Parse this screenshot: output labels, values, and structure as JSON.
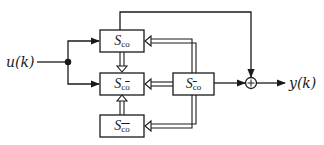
{
  "diagram": {
    "type": "block-diagram",
    "colors": {
      "stroke": "#1a1a1a",
      "background": "#ffffff"
    },
    "input": {
      "label": "u(k)"
    },
    "output": {
      "label": "y(k)"
    },
    "blocks": [
      {
        "id": "s_co",
        "symbol": "S",
        "subscript": "co",
        "sub_c_bar": false,
        "sub_o_bar": false
      },
      {
        "id": "s_c_obar",
        "symbol": "S",
        "subscript": "co",
        "sub_c_bar": false,
        "sub_o_bar": true
      },
      {
        "id": "s_cbar_obar",
        "symbol": "S",
        "subscript": "co",
        "sub_c_bar": true,
        "sub_o_bar": true
      },
      {
        "id": "s_cbar_o",
        "symbol": "S",
        "subscript": "co",
        "sub_c_bar": true,
        "sub_o_bar": false
      }
    ],
    "summing_junction": {
      "sign": "+"
    },
    "connections": [
      {
        "from": "u(k)",
        "to": "s_co",
        "style": "single-arrow"
      },
      {
        "from": "u(k)",
        "to": "s_c_obar",
        "style": "single-arrow"
      },
      {
        "from": "s_co",
        "to": "s_c_obar",
        "style": "double-arrow"
      },
      {
        "from": "s_cbar_obar",
        "to": "s_c_obar",
        "style": "double-arrow"
      },
      {
        "from": "s_cbar_o",
        "to": "s_co",
        "style": "double-arrow"
      },
      {
        "from": "s_cbar_o",
        "to": "s_c_obar",
        "style": "double-arrow"
      },
      {
        "from": "s_cbar_o",
        "to": "s_cbar_obar",
        "style": "double-arrow"
      },
      {
        "from": "s_co",
        "to": "sum",
        "style": "single-arrow"
      },
      {
        "from": "s_cbar_o",
        "to": "sum",
        "style": "single-arrow"
      },
      {
        "from": "sum",
        "to": "y(k)",
        "style": "single-arrow"
      }
    ]
  }
}
